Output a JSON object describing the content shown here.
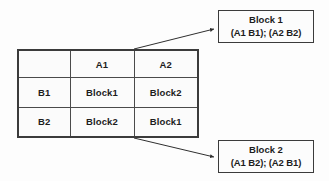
{
  "diagram": {
    "type": "factorial-design-table-with-callouts",
    "table": {
      "corner_label": "",
      "column_headers": [
        "A1",
        "A2"
      ],
      "row_headers": [
        "B1",
        "B2"
      ],
      "cells": [
        [
          "Block1",
          "Block2"
        ],
        [
          "Block2",
          "Block1"
        ]
      ]
    },
    "callouts": [
      {
        "id": "block1",
        "title": "Block 1",
        "detail": "(A1 B1); (A2 B2)"
      },
      {
        "id": "block2",
        "title": "Block 2",
        "detail": "(A1 B2); (A2 B1)"
      }
    ],
    "connectors": [
      {
        "id": "connector-block1",
        "from": "table-top-edge",
        "to": "callout-block1"
      },
      {
        "id": "connector-block2",
        "from": "table-bottom-edge",
        "to": "callout-block2"
      }
    ],
    "colors": {
      "line": "#3b3b3b",
      "grid": "#4a4a4a",
      "text": "#1d1d1d",
      "background": "#fdfdfd",
      "cell_fill": "#fbfbfb"
    }
  }
}
